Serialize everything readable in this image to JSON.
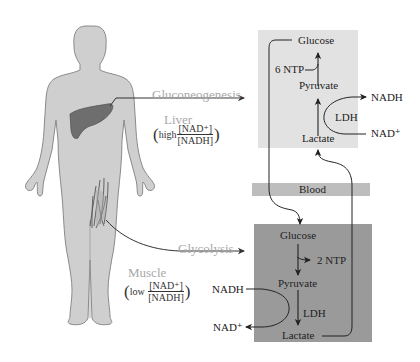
{
  "diagram": {
    "colors": {
      "body_fill": "#cfcfcf",
      "body_outline": "#8a8a8a",
      "liver_fill": "#6e6e6e",
      "liver_box": "#e2e2e2",
      "muscle_box": "#9a9a9a",
      "blood_band": "#bdbdbd",
      "label_gray": "#a8a8a8",
      "ink": "#222222"
    },
    "organs": {
      "liver": {
        "pathway": "Gluconeogenesis",
        "name": "Liver",
        "ratio_word": "high",
        "ratio_num": "[NAD⁺]",
        "ratio_den": "[NADH]"
      },
      "muscle": {
        "pathway": "Glycolysis",
        "name": "Muscle",
        "ratio_word": "low",
        "ratio_num": "[NAD⁺]",
        "ratio_den": "[NADH]"
      }
    },
    "liver_box": {
      "glucose": "Glucose",
      "energy": "6 NTP",
      "pyruvate": "Pyruvate",
      "enzyme": "LDH",
      "lactate": "Lactate",
      "cofactor_out": "NADH",
      "cofactor_in": "NAD⁺"
    },
    "blood": {
      "label": "Blood"
    },
    "muscle_box": {
      "glucose": "Glucose",
      "energy": "2 NTP",
      "pyruvate": "Pyruvate",
      "enzyme": "LDH",
      "lactate": "Lactate",
      "cofactor_in": "NADH",
      "cofactor_out": "NAD⁺"
    },
    "icons": {
      "human_body": "human-body-silhouette",
      "liver": "liver-organ",
      "muscle": "thigh-muscle"
    }
  }
}
